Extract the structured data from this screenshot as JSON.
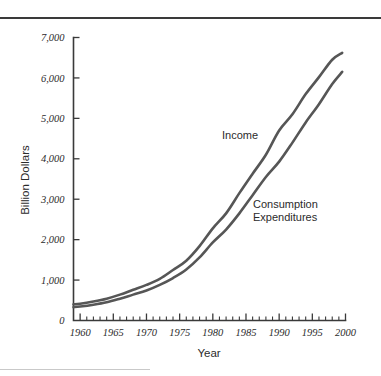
{
  "figure": {
    "background_color": "#ffffff",
    "rule_color": "#3a3a3a",
    "line_color": "#565656"
  },
  "chart_data": {
    "type": "line",
    "title": "",
    "xlabel": "Year",
    "ylabel": "Billion Dollars",
    "xlim": [
      1959,
      2000
    ],
    "ylim": [
      0,
      7000
    ],
    "grid": false,
    "legend_position": "inline-annotations",
    "x_ticks": [
      1960,
      1965,
      1970,
      1975,
      1980,
      1985,
      1990,
      1995,
      2000
    ],
    "x_tick_labels": [
      "1960",
      "1965",
      "1970",
      "1975",
      "1980",
      "1985",
      "1990",
      "1995",
      "2000"
    ],
    "x_minor_tick_step": 1,
    "y_ticks": [
      0,
      1000,
      2000,
      3000,
      4000,
      5000,
      6000,
      7000
    ],
    "y_tick_labels": [
      "0",
      "1,000",
      "2,000",
      "3,000",
      "4,000",
      "5,000",
      "6,000",
      "7,000"
    ],
    "x": [
      1959,
      1960,
      1962,
      1964,
      1966,
      1968,
      1970,
      1972,
      1974,
      1976,
      1978,
      1980,
      1982,
      1984,
      1986,
      1988,
      1990,
      1992,
      1994,
      1996,
      1998,
      1999.5
    ],
    "series": [
      {
        "name": "Income",
        "label": "Income",
        "color": "#565656",
        "values": [
          400,
          415,
          470,
          540,
          640,
          760,
          880,
          1030,
          1250,
          1480,
          1840,
          2280,
          2650,
          3150,
          3630,
          4100,
          4700,
          5100,
          5600,
          6020,
          6450,
          6620
        ]
      },
      {
        "name": "Consumption Expenditures",
        "label": "Consumption\nExpenditures",
        "color": "#565656",
        "values": [
          330,
          345,
          390,
          450,
          540,
          640,
          740,
          880,
          1050,
          1260,
          1560,
          1930,
          2250,
          2650,
          3100,
          3550,
          3930,
          4400,
          4900,
          5350,
          5850,
          6150
        ]
      }
    ],
    "annotations": [
      {
        "text": "Income",
        "x_px": 222,
        "y_px": 139
      },
      {
        "text": "Consumption",
        "x_px": 253,
        "y_px": 208
      },
      {
        "text": "Expenditures",
        "x_px": 253,
        "y_px": 221
      }
    ]
  }
}
